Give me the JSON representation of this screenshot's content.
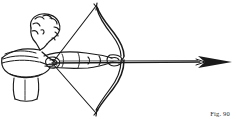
{
  "figure": {
    "caption": "Fig. 90",
    "title": "Archer drawing a bow with arrow in flight direction",
    "subject": "archer",
    "medium": "pen-and-ink line drawing",
    "background_color": "#ffffff",
    "ink_color": "#1a1a1a"
  },
  "elements": {
    "archer_label": "archer figure",
    "bow_label": "bow",
    "bowstring_label": "bowstring",
    "arrow_label": "arrow",
    "arrowhead_label": "arrowhead",
    "head_label": "archer head",
    "arms_label": "archer arms",
    "torso_label": "archer torso and garment",
    "hands_label": "hands gripping bow and string"
  }
}
